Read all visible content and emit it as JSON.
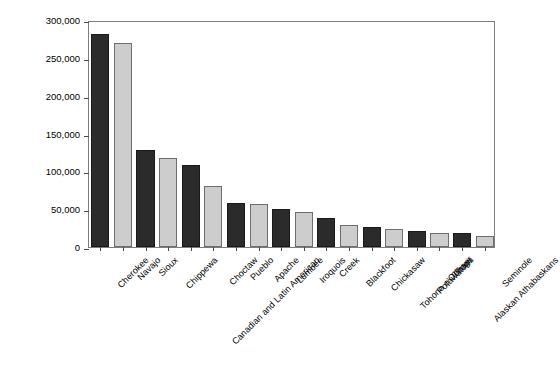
{
  "chart_data": {
    "type": "bar",
    "title": "",
    "xlabel": "",
    "ylabel": "Number of Tribe Members",
    "ylim": [
      0,
      300000
    ],
    "ytick_labels": [
      "300,000",
      "250,000",
      "200,000",
      "150,000",
      "100,000",
      "50,000",
      "0"
    ],
    "ytick_values": [
      300000,
      250000,
      200000,
      150000,
      100000,
      50000,
      0
    ],
    "grid": false,
    "legend": "none",
    "bar_colors": {
      "dark": "#2b2b2b",
      "light": "#cdcdcd"
    },
    "categories": [
      "Cherokee",
      "Navajo",
      "Sioux",
      "Chippewa",
      "Canadian and Latin American",
      "Choctaw",
      "Pueblo",
      "Apache",
      "Lumbee",
      "Iroquois",
      "Creek",
      "Blackfoot",
      "Chickasaw",
      "Tohono o'Odham",
      "Potawatomi",
      "Tlingit",
      "Alaskan Athabaskans",
      "Seminole"
    ],
    "values": [
      281000,
      270000,
      128000,
      118000,
      109000,
      81000,
      58000,
      57000,
      50000,
      46000,
      39000,
      29000,
      26000,
      24000,
      21000,
      19000,
      18000,
      15000
    ],
    "shades": [
      "dark",
      "light",
      "dark",
      "light",
      "dark",
      "light",
      "dark",
      "light",
      "dark",
      "light",
      "dark",
      "light",
      "dark",
      "light",
      "dark",
      "light",
      "dark",
      "light"
    ]
  }
}
